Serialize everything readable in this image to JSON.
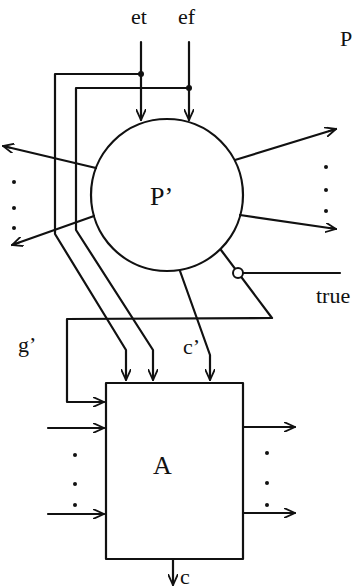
{
  "diagram": {
    "title_label": "P",
    "inner_process": {
      "label": "P’",
      "shape": "circle",
      "cx": 167,
      "cy": 195,
      "r": 76
    },
    "automaton": {
      "label": "A",
      "shape": "rectangle",
      "x": 106,
      "y": 383,
      "width": 137,
      "height": 176
    },
    "inputs": {
      "et": "et",
      "ef": "ef"
    },
    "signals": {
      "g_prime": "g’",
      "c_prime": "c’",
      "true": "true",
      "c": "c"
    },
    "ellipsis": "⋮",
    "colors": {
      "stroke": "#111111",
      "background": "#ffffff"
    },
    "edges": [
      {
        "from": "et",
        "to": "P’",
        "type": "arrow"
      },
      {
        "from": "ef",
        "to": "P’",
        "type": "arrow"
      },
      {
        "from": "et",
        "to": "A",
        "type": "arrow",
        "via": "junction"
      },
      {
        "from": "ef",
        "to": "A",
        "type": "arrow",
        "via": "junction"
      },
      {
        "from": "P’",
        "to": "A",
        "label": "c’",
        "type": "arrow"
      },
      {
        "from": "P’",
        "to": "A",
        "label": "g’",
        "type": "arrow",
        "via": "negated-true-feedback"
      },
      {
        "from": "true",
        "to": "g’",
        "type": "negated-input"
      },
      {
        "from": "P’",
        "to": "outputs-left",
        "type": "arrow",
        "count": "many"
      },
      {
        "from": "P’",
        "to": "outputs-right",
        "type": "arrow",
        "count": "many"
      },
      {
        "from": "inputs-left",
        "to": "A",
        "type": "arrow",
        "count": "many"
      },
      {
        "from": "A",
        "to": "outputs-right",
        "type": "arrow",
        "count": "many"
      },
      {
        "from": "A",
        "to": "c",
        "type": "arrow"
      }
    ]
  }
}
